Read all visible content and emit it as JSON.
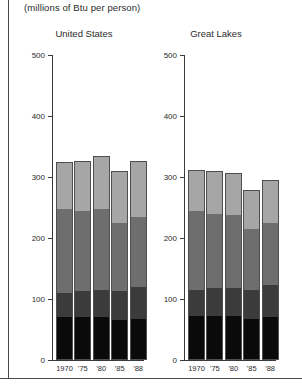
{
  "units_note": "(millions of Btu per person)",
  "axis": {
    "ticks": [
      "500",
      "400",
      "300",
      "200",
      "100",
      "0"
    ],
    "tick_values": [
      500,
      400,
      300,
      200,
      100,
      0
    ],
    "ymin": 0,
    "ymax": 500
  },
  "panels": [
    {
      "title": "United States"
    },
    {
      "title": "Great Lakes"
    }
  ],
  "chart_data": {
    "type": "bar",
    "title": "",
    "subtitle": "(millions of Btu per person)",
    "xlabel": "",
    "ylabel": "",
    "ylim": [
      0,
      500
    ],
    "stacked": true,
    "grid": false,
    "legend": "none",
    "categories": [
      "1970",
      "'75",
      "'80",
      "'85",
      "'88"
    ],
    "panels": [
      {
        "name": "United States",
        "series": [
          {
            "name": "segment-1",
            "color": "#0a0a0a",
            "values": [
              70,
              70,
              70,
              65,
              68
            ]
          },
          {
            "name": "segment-2",
            "color": "#3b3b3b",
            "values": [
              40,
              43,
              45,
              48,
              52
            ]
          },
          {
            "name": "segment-3",
            "color": "#6e6e6e",
            "values": [
              138,
              132,
              133,
              112,
              115
            ]
          },
          {
            "name": "segment-4",
            "color": "#a6a6a6",
            "values": [
              77,
              82,
              87,
              85,
              92
            ]
          }
        ],
        "totals": [
          325,
          327,
          335,
          310,
          327
        ]
      },
      {
        "name": "Great Lakes",
        "series": [
          {
            "name": "segment-1",
            "color": "#0a0a0a",
            "values": [
              72,
              72,
              72,
              68,
              70
            ]
          },
          {
            "name": "segment-2",
            "color": "#3b3b3b",
            "values": [
              43,
              46,
              46,
              47,
              53
            ]
          },
          {
            "name": "segment-3",
            "color": "#6e6e6e",
            "values": [
              130,
              122,
              120,
              99,
              102
            ]
          },
          {
            "name": "segment-4",
            "color": "#a6a6a6",
            "values": [
              67,
              70,
              69,
              64,
              70
            ]
          }
        ],
        "totals": [
          312,
          310,
          307,
          278,
          295
        ]
      }
    ]
  }
}
